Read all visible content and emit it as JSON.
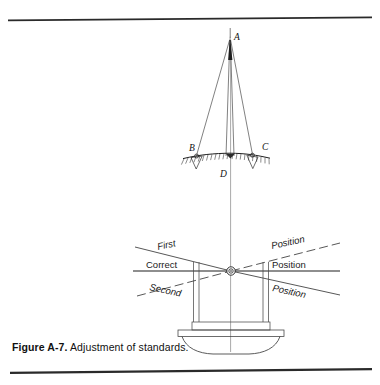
{
  "figure": {
    "caption_label": "Figure A-7.",
    "caption_text": "Adjustment of standards.",
    "page_rules": {
      "top_rule": true,
      "bottom_rule": true
    }
  },
  "diagram": {
    "title": "Adjustment of standards",
    "type": "technical-line-drawing",
    "stroke_color": "#1a1a1a",
    "background_color": "#ffffff",
    "point_labels": [
      {
        "id": "A",
        "label": "A",
        "x": 234,
        "y": 40,
        "description": "apex above instrument"
      },
      {
        "id": "B",
        "label": "B",
        "x": 189,
        "y": 151,
        "description": "left ground target"
      },
      {
        "id": "C",
        "label": "C",
        "x": 262,
        "y": 150,
        "description": "right ground target"
      },
      {
        "id": "D",
        "label": "D",
        "x": 220,
        "y": 177,
        "description": "center point below ground line"
      }
    ],
    "left_labels": [
      {
        "id": "first",
        "label": "First",
        "x": 158,
        "y": 250,
        "rotation": -12
      },
      {
        "id": "correct",
        "label": "Correct",
        "x": 146,
        "y": 272,
        "rotation": 0
      },
      {
        "id": "second",
        "label": "Second",
        "x": 149,
        "y": 289,
        "rotation": 12
      }
    ],
    "right_labels": [
      {
        "id": "position-first",
        "label": "Position",
        "x": 272,
        "y": 250,
        "rotation": -12
      },
      {
        "id": "position-correct",
        "label": "Position",
        "x": 272,
        "y": 272,
        "rotation": 0
      },
      {
        "id": "position-second",
        "label": "Position",
        "x": 272,
        "y": 289,
        "rotation": 12
      }
    ],
    "pivot": {
      "x": 231,
      "y": 271,
      "outer_r": 4.2,
      "inner_r": 2.2
    },
    "ground_line": {
      "x1": 183,
      "x2": 270,
      "y": 157
    }
  }
}
